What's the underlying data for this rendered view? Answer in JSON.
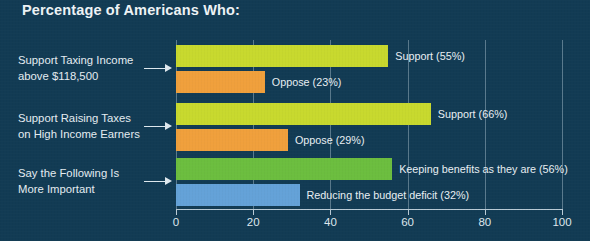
{
  "chart_data": {
    "type": "bar",
    "orientation": "horizontal",
    "title": "Percentage of Americans Who:",
    "xlabel": "",
    "ylabel": "",
    "xlim": [
      0,
      100
    ],
    "xticks": [
      0,
      20,
      40,
      60,
      80,
      100
    ],
    "xtick_labels": [
      "0",
      "20",
      "40",
      "60",
      "80",
      "100"
    ],
    "grid": "vertical",
    "legend": "none",
    "categories": [
      "Support Taxing Income\nabove $118,500",
      "Support Raising Taxes\non High Income Earners",
      "Say the Following Is\nMore Important"
    ],
    "groups": [
      {
        "category": "Support Taxing Income\nabove $118,500",
        "bars": [
          {
            "label": "Support (55%)",
            "value": 55,
            "color": "#c8d92e"
          },
          {
            "label": "Oppose (23%)",
            "value": 23,
            "color": "#f0a03c"
          }
        ]
      },
      {
        "category": "Support Raising Taxes\non High Income Earners",
        "bars": [
          {
            "label": "Support (66%)",
            "value": 66,
            "color": "#c8d92e"
          },
          {
            "label": "Oppose (29%)",
            "value": 29,
            "color": "#f0a03c"
          }
        ]
      },
      {
        "category": "Say the Following Is\nMore Important",
        "bars": [
          {
            "label": "Keeping benefits as they are (56%)",
            "value": 56,
            "color": "#6cbe3f"
          },
          {
            "label": "Reducing the budget deficit (32%)",
            "value": 32,
            "color": "#64a2d8"
          }
        ]
      }
    ]
  },
  "colors": {
    "background": "#123b54",
    "text": "#e8eef2",
    "axis": "#b9cbd6",
    "grid": "rgba(190,210,222,.42)",
    "yellow_green": "#c8d92e",
    "orange": "#f0a03c",
    "green": "#6cbe3f",
    "blue": "#64a2d8"
  }
}
